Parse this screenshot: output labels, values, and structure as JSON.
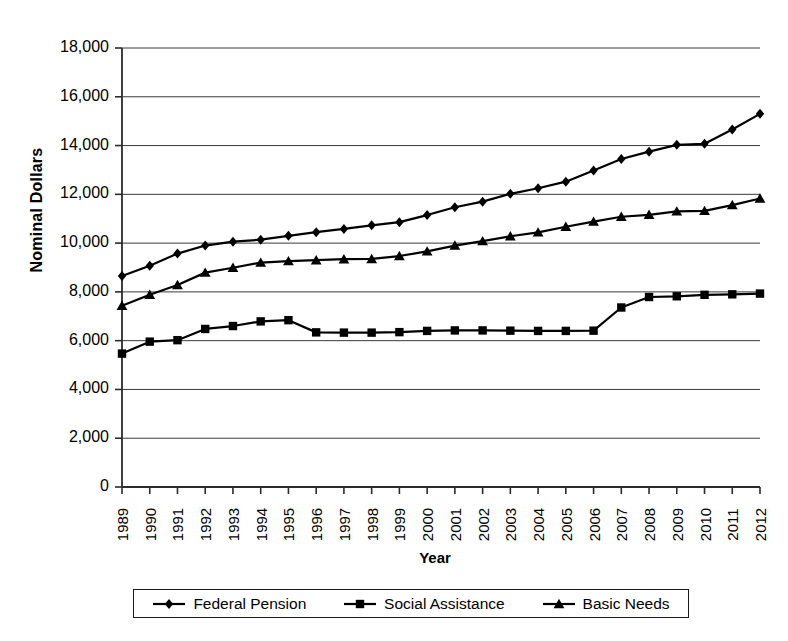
{
  "chart_data": {
    "type": "line",
    "title": "",
    "subtitle": "",
    "xlabel": "Year",
    "ylabel": "Nominal Dollars",
    "ylim": [
      0,
      18000
    ],
    "ytick_labels": [
      "0",
      "2,000",
      "4,000",
      "6,000",
      "8,000",
      "10,000",
      "12,000",
      "14,000",
      "16,000",
      "18,000"
    ],
    "ytick_values": [
      0,
      2000,
      4000,
      6000,
      8000,
      10000,
      12000,
      14000,
      16000,
      18000
    ],
    "grid": "horizontal",
    "legend_position": "bottom",
    "categories": [
      "1989",
      "1990",
      "1991",
      "1992",
      "1993",
      "1994",
      "1995",
      "1996",
      "1997",
      "1998",
      "1999",
      "2000",
      "2001",
      "2002",
      "2003",
      "2004",
      "2005",
      "2006",
      "2007",
      "2008",
      "2009",
      "2010",
      "2011",
      "2012"
    ],
    "x": [
      1989,
      1990,
      1991,
      1992,
      1993,
      1994,
      1995,
      1996,
      1997,
      1998,
      1999,
      2000,
      2001,
      2002,
      2003,
      2004,
      2005,
      2006,
      2007,
      2008,
      2009,
      2010,
      2011,
      2012
    ],
    "series": [
      {
        "name": "Federal Pension",
        "marker": "diamond",
        "color": "#000000",
        "values": [
          8650,
          9070,
          9570,
          9900,
          10060,
          10140,
          10300,
          10450,
          10580,
          10730,
          10860,
          11150,
          11470,
          11700,
          12020,
          12250,
          12520,
          12980,
          13450,
          13750,
          14030,
          14070,
          14660,
          15300
        ]
      },
      {
        "name": "Social Assistance",
        "marker": "square",
        "color": "#000000",
        "values": [
          5470,
          5960,
          6020,
          6480,
          6600,
          6790,
          6840,
          6340,
          6330,
          6330,
          6350,
          6400,
          6420,
          6420,
          6410,
          6400,
          6400,
          6410,
          7360,
          7790,
          7820,
          7880,
          7900,
          7930
        ]
      },
      {
        "name": "Basic Needs",
        "marker": "triangle",
        "color": "#000000",
        "values": [
          7430,
          7880,
          8280,
          8790,
          8990,
          9200,
          9260,
          9300,
          9340,
          9350,
          9470,
          9660,
          9900,
          10080,
          10280,
          10440,
          10670,
          10880,
          11080,
          11160,
          11300,
          11320,
          11560,
          11830
        ]
      }
    ]
  },
  "axes": {
    "x_label": "Year",
    "y_label": "Nominal Dollars"
  },
  "legend": {
    "entries": [
      {
        "label": "Federal Pension",
        "marker": "diamond"
      },
      {
        "label": "Social Assistance",
        "marker": "square"
      },
      {
        "label": "Basic Needs",
        "marker": "triangle"
      }
    ]
  }
}
